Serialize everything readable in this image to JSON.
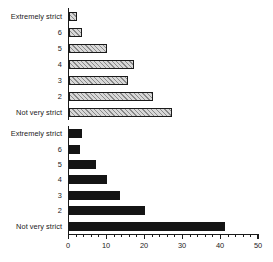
{
  "chart_data": {
    "type": "bar",
    "title": "",
    "subtitle": "",
    "xlabel": "",
    "ylabel": "",
    "orientation": "horizontal",
    "xlim": [
      0,
      50
    ],
    "grid": false,
    "legend": "none",
    "panels": [
      {
        "name": "top-panel",
        "fill": "hatched",
        "categories": [
          "Extremely strict",
          "6",
          "5",
          "4",
          "3",
          "2",
          "Not very strict"
        ],
        "values": [
          2,
          3.5,
          10,
          17,
          15.5,
          22,
          27
        ]
      },
      {
        "name": "bottom-panel",
        "fill": "solid",
        "categories": [
          "Extremely strict",
          "6",
          "5",
          "4",
          "3",
          "2",
          "Not very strict"
        ],
        "values": [
          3.5,
          3,
          7,
          10,
          13.5,
          20,
          41
        ]
      }
    ],
    "xticks": [
      0,
      10,
      20,
      30,
      40,
      50
    ],
    "xtick_labels": [
      "0",
      "10",
      "20",
      "30",
      "40",
      "50"
    ],
    "xminor_step": 2,
    "colors": {
      "axis": "#1a1a1a",
      "hatch_bar_fill": "#d8d8d8",
      "hatch_bar_line": "#8a8a8a",
      "solid_bar_fill": "#141414",
      "background": "#ffffff"
    }
  }
}
